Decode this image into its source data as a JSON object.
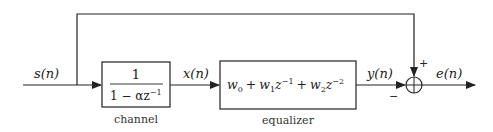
{
  "diagram": {
    "signals": {
      "input": "s(n)",
      "channel_output": "x(n)",
      "equalizer_output": "y(n)",
      "error": "e(n)"
    },
    "blocks": {
      "channel": {
        "label": "channel",
        "numerator": "1",
        "denominator_prefix": "1 − αz",
        "denominator_exp": "−1"
      },
      "equalizer": {
        "label": "equalizer",
        "terms": [
          {
            "base": "w",
            "sub": "0",
            "z": "",
            "exp": ""
          },
          {
            "op": "+",
            "base": "w",
            "sub": "1",
            "z": "z",
            "exp": "−1"
          },
          {
            "op": "+",
            "base": "w",
            "sub": "2",
            "z": "z",
            "exp": "−2"
          }
        ]
      }
    },
    "summing_junction": {
      "plus_sign": "+",
      "minus_sign": "−"
    },
    "colors": {
      "line": "#222222",
      "background": "#ffffff"
    }
  }
}
